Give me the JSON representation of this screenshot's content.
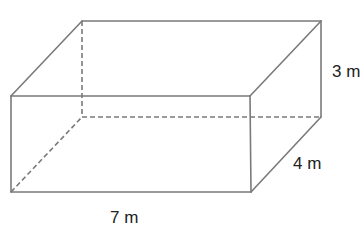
{
  "figure": {
    "type": "rectangular-prism",
    "line_color": "#7a7a7a",
    "text_color": "#222222",
    "vertices": {
      "front_top_left": [
        11,
        96
      ],
      "front_top_right": [
        250,
        96
      ],
      "front_bottom_left": [
        11,
        192
      ],
      "front_bottom_right": [
        251,
        192
      ],
      "back_top_left": [
        82,
        21
      ],
      "back_top_right": [
        321,
        21
      ],
      "back_bottom_left": [
        82,
        117
      ],
      "back_bottom_right": [
        321,
        117
      ]
    }
  },
  "labels": {
    "height": "3 m",
    "depth": "4 m",
    "length": "7 m"
  }
}
